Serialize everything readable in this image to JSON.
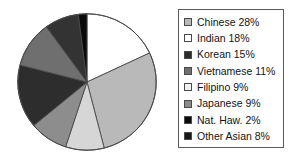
{
  "chart_data": {
    "type": "pie",
    "title": "",
    "xlabel": "",
    "ylabel": "",
    "legend_position": "right",
    "grid": false,
    "start_angle_deg": 0,
    "direction": "clockwise",
    "total_percent": 100,
    "categories": [
      "Indian",
      "Chinese",
      "Filipino",
      "Japanese",
      "Korean",
      "Vietnamese",
      "Other Asian",
      "Nat. Haw."
    ],
    "values": [
      18,
      28,
      9,
      9,
      15,
      11,
      8,
      2
    ],
    "slices": [
      {
        "label": "Indian",
        "value": 18,
        "color": "#ffffff",
        "order": 1
      },
      {
        "label": "Chinese",
        "value": 28,
        "color": "#b9b9b9",
        "order": 2
      },
      {
        "label": "Filipino",
        "value": 9,
        "color": "#d6d6d6",
        "order": 3
      },
      {
        "label": "Japanese",
        "value": 9,
        "color": "#8d8d8d",
        "order": 4
      },
      {
        "label": "Korean",
        "value": 15,
        "color": "#2d2d2d",
        "order": 5
      },
      {
        "label": "Vietnamese",
        "value": 11,
        "color": "#6f6f6f",
        "order": 6
      },
      {
        "label": "Other Asian",
        "value": 8,
        "color": "#333333",
        "order": 7
      },
      {
        "label": "Nat. Haw.",
        "value": 2,
        "color": "#0a0a0a",
        "order": 8
      }
    ]
  },
  "legend": {
    "items": [
      {
        "label": "Chinese 28%",
        "swatch": "#b9b9b9",
        "name": "chinese"
      },
      {
        "label": "Indian 18%",
        "swatch": "#ffffff",
        "name": "indian"
      },
      {
        "label": "Korean 15%",
        "swatch": "#2d2d2d",
        "name": "korean"
      },
      {
        "label": "Vietnamese 11%",
        "swatch": "#6f6f6f",
        "name": "vietnamese"
      },
      {
        "label": "Filipino 9%",
        "swatch": "#f2f2f2",
        "name": "filipino"
      },
      {
        "label": "Japanese 9%",
        "swatch": "#8d8d8d",
        "name": "japanese"
      },
      {
        "label": "Nat. Haw. 2%",
        "swatch": "#0a0a0a",
        "name": "nat-haw"
      },
      {
        "label": "Other Asian 8%",
        "swatch": "#1a1a1a",
        "name": "other-asian"
      }
    ]
  },
  "style": {
    "pie_outline": "#4a4a4a",
    "legend_border": "#5a5a5a",
    "text_color": "#131313",
    "background": "#ffffff"
  }
}
